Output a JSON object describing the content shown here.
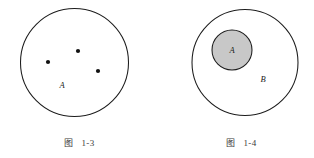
{
  "page": {
    "background_color": "#ffffff",
    "width": 314,
    "height": 158
  },
  "figures": [
    {
      "id": "fig-1-3",
      "caption_cjk": "图",
      "caption_number": "1-3",
      "description": "set A drawn as a circle containing three element points",
      "outline": {
        "cx": 74.5,
        "cy": 62.5,
        "r": 54,
        "fill": "#ffffff",
        "stroke": "#1c1c1c"
      },
      "set_label": {
        "text": "A",
        "x": 62,
        "y": 88
      },
      "elements": [
        {
          "cx": 48,
          "cy": 62,
          "r": 2.1
        },
        {
          "cx": 78,
          "cy": 51,
          "r": 2.1
        },
        {
          "cx": 98,
          "cy": 71,
          "r": 2.1
        }
      ]
    },
    {
      "id": "fig-1-4",
      "caption_cjk": "图",
      "caption_number": "1-4",
      "description": "set A shaded inside larger set B, showing subset relation",
      "outline": {
        "cx": 245,
        "cy": 62.5,
        "r": 53,
        "fill": "#ffffff",
        "stroke": "#1c1c1c"
      },
      "inner": {
        "cx": 232,
        "cy": 50,
        "r": 20,
        "fill": "#c8c8c8",
        "stroke": "#1c1c1c"
      },
      "inner_label": {
        "text": "A",
        "x": 232,
        "y": 53
      },
      "outer_label": {
        "text": "B",
        "x": 263,
        "y": 82
      }
    }
  ],
  "captions": [
    {
      "cjk_x": 68,
      "num_x": 88,
      "y": 146
    },
    {
      "cjk_x": 230,
      "num_x": 250,
      "y": 146
    }
  ]
}
